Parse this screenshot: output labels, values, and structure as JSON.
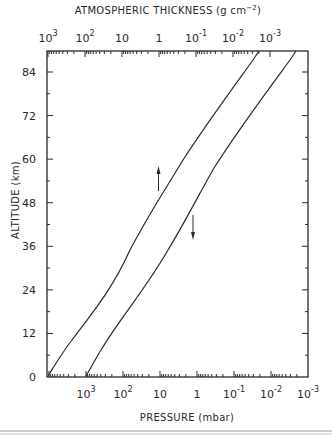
{
  "chart_data": {
    "type": "line",
    "title": "",
    "top_axis": {
      "label": "ATMOSPHERIC THICKNESS (g cm⁻²)",
      "label_text": "ATMOSPHERIC THICKNESS (g cm",
      "label_sup": "−2",
      "label_close": ")",
      "scale": "log",
      "direction": "decreasing",
      "ticks": [
        {
          "base": "10",
          "exp": "3"
        },
        {
          "base": "10",
          "exp": "2"
        },
        {
          "base": "10",
          "exp": ""
        },
        {
          "base": "1",
          "exp": ""
        },
        {
          "base": "10",
          "exp": "-1"
        },
        {
          "base": "10",
          "exp": "-2"
        },
        {
          "base": "10",
          "exp": "-3"
        }
      ],
      "tick_values": [
        1000,
        100,
        10,
        1,
        0.1,
        0.01,
        0.001
      ]
    },
    "xlabel": "PRESSURE (mbar)",
    "x_scale": "log",
    "x_direction": "decreasing",
    "xlim": [
      10000,
      0.001
    ],
    "x_ticks": [
      {
        "base": "10",
        "exp": "3"
      },
      {
        "base": "10",
        "exp": "2"
      },
      {
        "base": "10",
        "exp": ""
      },
      {
        "base": "1",
        "exp": ""
      },
      {
        "base": "10",
        "exp": "-1"
      },
      {
        "base": "10",
        "exp": "-2"
      },
      {
        "base": "10",
        "exp": "-3"
      }
    ],
    "x_tick_values": [
      1000,
      100,
      10,
      1,
      0.1,
      0.01,
      0.001
    ],
    "ylabel": "ALTITUDE (km)",
    "ylim": [
      0,
      90
    ],
    "y_ticks": [
      "0",
      "12",
      "24",
      "36",
      "48",
      "60",
      "72",
      "84"
    ],
    "y_tick_values": [
      0,
      12,
      24,
      36,
      48,
      60,
      72,
      84
    ],
    "grid": false,
    "legend": null,
    "series": [
      {
        "name": "Atmospheric thickness (read on top axis)",
        "axis": "top",
        "x": [
          1000,
          100,
          10,
          1,
          0.1,
          0.01,
          0.0025
        ],
        "y": [
          0,
          14,
          33,
          48,
          63,
          80,
          90
        ]
      },
      {
        "name": "Pressure (read on bottom axis)",
        "axis": "bottom",
        "x": [
          1000,
          400,
          100,
          10,
          1,
          0.1,
          0.01,
          0.002
        ],
        "y": [
          0,
          7.4,
          16,
          31,
          47,
          63,
          80,
          90
        ]
      }
    ],
    "annotations": [
      {
        "type": "arrow",
        "direction": "up",
        "note": "points to upper curve (use top axis)",
        "approx_x_pressure": 3,
        "approx_y_km": 54
      },
      {
        "type": "arrow",
        "direction": "down",
        "note": "points to lower curve (use bottom axis)",
        "approx_x_pressure": 0.3,
        "approx_y_km": 41
      }
    ]
  }
}
